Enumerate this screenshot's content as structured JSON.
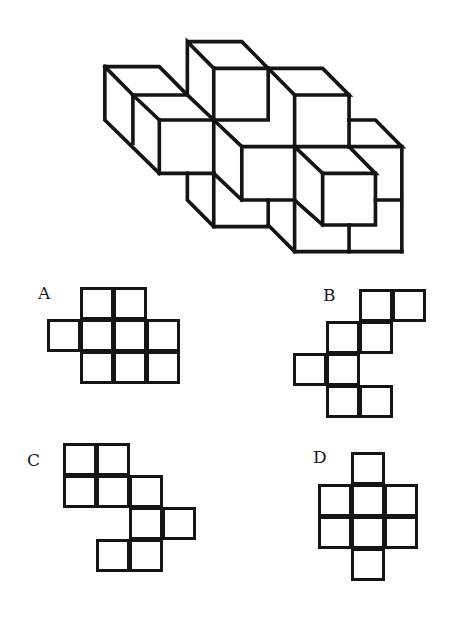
{
  "figure": {
    "stroke_color": "#141414",
    "segments": [
      "M295,35 H460 L540,115 H375 L295,35 V190",
      "M375,115 V270 H540 V115",
      "M540,115 H705 L785,195 H620 L540,115",
      "M620,195 V350 M785,195 V350",
      "M785,270 H865 L945,350 H785",
      "M945,350 V665 M865,510 H945",
      "M620,350 H785 L865,430 H705 L620,350",
      "M705,430 V585 H865 V430",
      "M375,270 L460,350 H620",
      "M460,350 V510 H620",
      "M375,270 V430 L460,510",
      "M45,110 H210 L290,190 L375,270",
      "M45,110 L130,195 H290",
      "M45,110 V270 L210,430",
      "M130,195 V340",
      "M130,195 L210,270 H375",
      "M210,270 V430 H375",
      "M295,430 V510 L375,590 H540 V510",
      "M375,430 V590",
      "M540,585 L620,665 H945",
      "M620,350 V665",
      "M785,585 V665",
      "M620,510 L705,585"
    ]
  },
  "options": [
    {
      "label": "A",
      "label_pos": [
        38,
        285
      ],
      "origin": [
        47,
        287
      ],
      "cells": [
        [
          1,
          0
        ],
        [
          2,
          0
        ],
        [
          0,
          1
        ],
        [
          1,
          1
        ],
        [
          2,
          1
        ],
        [
          3,
          1
        ],
        [
          1,
          2
        ],
        [
          2,
          2
        ],
        [
          3,
          2
        ]
      ]
    },
    {
      "label": "B",
      "label_pos": [
        323,
        287
      ],
      "origin": [
        293,
        289
      ],
      "cells": [
        [
          2,
          0
        ],
        [
          3,
          0
        ],
        [
          1,
          1
        ],
        [
          2,
          1
        ],
        [
          0,
          2
        ],
        [
          1,
          2
        ],
        [
          1,
          3
        ],
        [
          2,
          3
        ]
      ]
    },
    {
      "label": "C",
      "label_pos": [
        27,
        452
      ],
      "origin": [
        63,
        443
      ],
      "cells": [
        [
          0,
          0
        ],
        [
          1,
          0
        ],
        [
          0,
          1
        ],
        [
          1,
          1
        ],
        [
          2,
          1
        ],
        [
          2,
          2
        ],
        [
          3,
          2
        ],
        [
          1,
          3
        ],
        [
          2,
          3
        ]
      ]
    },
    {
      "label": "D",
      "label_pos": [
        313,
        449
      ],
      "origin": [
        318,
        452
      ],
      "cells": [
        [
          1,
          0
        ],
        [
          0,
          1
        ],
        [
          1,
          1
        ],
        [
          2,
          1
        ],
        [
          0,
          2
        ],
        [
          1,
          2
        ],
        [
          2,
          2
        ],
        [
          1,
          3
        ]
      ]
    }
  ],
  "cell_size": 34
}
